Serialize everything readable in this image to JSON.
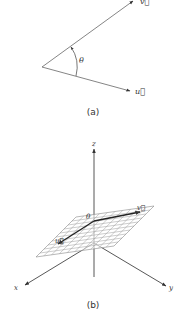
{
  "figure_a": {
    "vector_v_label": "v⃗",
    "vector_u_label": "u⃗",
    "angle_label": "θ",
    "caption": "(a)"
  },
  "figure_b": {
    "axis_x_label": "x",
    "axis_y_label": "y",
    "axis_z_label": "z",
    "vector_u_label": "u⃗",
    "vector_v_label": "v⃗",
    "angle_label": "θ",
    "caption": "(b)"
  },
  "colors": {
    "line": "#555555",
    "vector_bold": "#222222",
    "grid": "#999999",
    "text": "#333333"
  }
}
